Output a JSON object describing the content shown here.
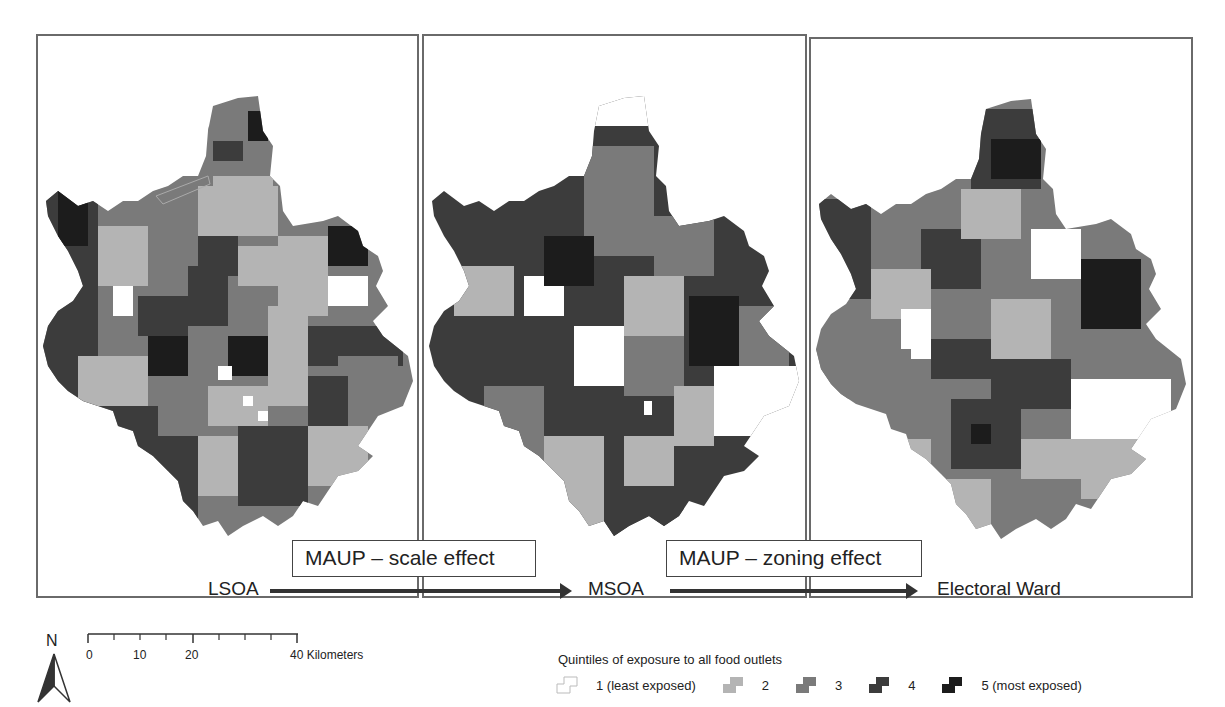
{
  "panels": [
    {
      "id": "lsoa",
      "name": "LSOA"
    },
    {
      "id": "msoa",
      "name": "MSOA"
    },
    {
      "id": "ward",
      "name": "Electoral Ward"
    }
  ],
  "transitions": [
    {
      "label": "MAUP – scale effect",
      "from": "LSOA",
      "to": "MSOA"
    },
    {
      "label": "MAUP – zoning effect",
      "from": "MSOA",
      "to": "Electoral Ward"
    }
  ],
  "north_arrow": {
    "label": "N"
  },
  "scale_bar": {
    "ticks": [
      "0",
      "10",
      "20",
      "40 Kilometers"
    ],
    "unit": "Kilometers",
    "max": 40
  },
  "legend": {
    "title": "Quintiles of exposure to all food outlets",
    "items": [
      {
        "label": "1 (least exposed)",
        "color": "#ffffff"
      },
      {
        "label": "2",
        "color": "#b4b4b4"
      },
      {
        "label": "3",
        "color": "#7a7a7a"
      },
      {
        "label": "4",
        "color": "#3c3c3c"
      },
      {
        "label": "5 (most exposed)",
        "color": "#1c1c1c"
      }
    ]
  },
  "colors": {
    "q1": "#ffffff",
    "q2": "#b4b4b4",
    "q3": "#7a7a7a",
    "q4": "#3c3c3c",
    "q5": "#1c1c1c",
    "border": "#6a6a6a"
  }
}
